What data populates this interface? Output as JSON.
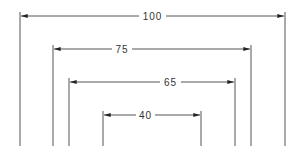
{
  "diagram": {
    "type": "nested-dimension-lines",
    "line_color": "#555555",
    "arrow_color": "#222222",
    "dimensions": [
      {
        "label": "100",
        "x1": 20,
        "x2": 285,
        "y": 16,
        "top": 12,
        "bottom": 146
      },
      {
        "label": "75",
        "x1": 53,
        "x2": 251,
        "y": 49,
        "top": 45,
        "bottom": 146
      },
      {
        "label": "65",
        "x1": 69,
        "x2": 235,
        "y": 82,
        "top": 78,
        "bottom": 146
      },
      {
        "label": "40",
        "x1": 103,
        "x2": 201,
        "y": 115,
        "top": 111,
        "bottom": 146
      }
    ]
  }
}
